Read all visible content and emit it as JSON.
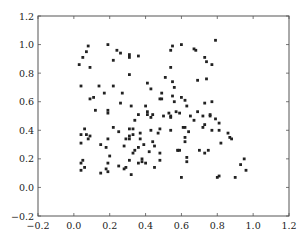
{
  "chart_data": {
    "type": "scatter",
    "title": "",
    "xlabel": "",
    "ylabel": "",
    "xlim": [
      -0.2,
      1.2
    ],
    "ylim": [
      -0.2,
      1.2
    ],
    "grid": false,
    "legend": null,
    "x_ticks": [
      "-0.2",
      "0.0",
      "0.2",
      "0.4",
      "0.6",
      "0.8",
      "1.0",
      "1.2"
    ],
    "y_ticks": [
      "-0.2",
      "0.0",
      "0.2",
      "0.4",
      "0.6",
      "0.8",
      "1.0",
      "1.2"
    ],
    "marker_color": "#222222",
    "series": [
      {
        "name": "points",
        "points": [
          [
            0.08,
            0.99
          ],
          [
            0.07,
            0.95
          ],
          [
            0.05,
            0.91
          ],
          [
            0.03,
            0.86
          ],
          [
            0.09,
            0.84
          ],
          [
            0.19,
            1.0
          ],
          [
            0.24,
            0.96
          ],
          [
            0.26,
            0.94
          ],
          [
            0.22,
            0.89
          ],
          [
            0.04,
            0.71
          ],
          [
            0.17,
            0.66
          ],
          [
            0.31,
            0.93
          ],
          [
            0.31,
            0.91
          ],
          [
            0.36,
            0.92
          ],
          [
            0.31,
            0.79
          ],
          [
            0.54,
            0.96
          ],
          [
            0.54,
            0.84
          ],
          [
            0.51,
            0.77
          ],
          [
            0.55,
            0.99
          ],
          [
            0.6,
            1.0
          ],
          [
            0.67,
            0.97
          ],
          [
            0.68,
            0.96
          ],
          [
            0.73,
            0.91
          ],
          [
            0.74,
            0.88
          ],
          [
            0.77,
            0.86
          ],
          [
            0.79,
            1.03
          ],
          [
            0.55,
            0.74
          ],
          [
            0.56,
            0.7
          ],
          [
            0.74,
            0.76
          ],
          [
            0.11,
            0.63
          ],
          [
            0.14,
            0.71
          ],
          [
            0.09,
            0.62
          ],
          [
            0.26,
            0.59
          ],
          [
            0.19,
            0.54
          ],
          [
            0.19,
            0.52
          ],
          [
            0.22,
            0.71
          ],
          [
            0.27,
            0.66
          ],
          [
            0.12,
            0.54
          ],
          [
            0.09,
            0.36
          ],
          [
            0.22,
            0.42
          ],
          [
            0.25,
            0.39
          ],
          [
            0.32,
            0.57
          ],
          [
            0.41,
            0.73
          ],
          [
            0.49,
            0.66
          ],
          [
            0.43,
            0.69
          ],
          [
            0.55,
            0.64
          ],
          [
            0.48,
            0.62
          ],
          [
            0.6,
            0.63
          ],
          [
            0.62,
            0.61
          ],
          [
            0.69,
            0.75
          ],
          [
            0.49,
            0.62
          ],
          [
            0.56,
            0.6
          ],
          [
            0.54,
            0.49
          ],
          [
            0.53,
            0.52
          ],
          [
            0.57,
            0.53
          ],
          [
            0.59,
            0.52
          ],
          [
            0.4,
            0.57
          ],
          [
            0.41,
            0.53
          ],
          [
            0.41,
            0.51
          ],
          [
            0.44,
            0.51
          ],
          [
            0.36,
            0.51
          ],
          [
            0.34,
            0.47
          ],
          [
            0.43,
            0.49
          ],
          [
            0.54,
            0.5
          ],
          [
            0.5,
            0.5
          ],
          [
            0.63,
            0.57
          ],
          [
            0.65,
            0.5
          ],
          [
            0.67,
            0.47
          ],
          [
            0.69,
            0.53
          ],
          [
            0.77,
            0.6
          ],
          [
            0.76,
            0.5
          ],
          [
            0.79,
            0.48
          ],
          [
            0.81,
            0.45
          ],
          [
            0.73,
            0.44
          ],
          [
            0.61,
            0.42
          ],
          [
            0.64,
            0.39
          ],
          [
            0.72,
            0.42
          ],
          [
            0.72,
            0.5
          ],
          [
            0.76,
            0.51
          ],
          [
            0.73,
            0.59
          ],
          [
            0.06,
            0.41
          ],
          [
            0.04,
            0.37
          ],
          [
            0.07,
            0.37
          ],
          [
            0.08,
            0.34
          ],
          [
            0.04,
            0.31
          ],
          [
            0.19,
            0.34
          ],
          [
            0.15,
            0.3
          ],
          [
            0.18,
            0.28
          ],
          [
            0.29,
            0.34
          ],
          [
            0.33,
            0.41
          ],
          [
            0.31,
            0.41
          ],
          [
            0.33,
            0.37
          ],
          [
            0.31,
            0.34
          ],
          [
            0.28,
            0.29
          ],
          [
            0.39,
            0.3
          ],
          [
            0.45,
            0.29
          ],
          [
            0.48,
            0.24
          ],
          [
            0.48,
            0.41
          ],
          [
            0.47,
            0.38
          ],
          [
            0.54,
            0.4
          ],
          [
            0.43,
            0.4
          ],
          [
            0.37,
            0.38
          ],
          [
            0.62,
            0.35
          ],
          [
            0.62,
            0.32
          ],
          [
            0.7,
            0.26
          ],
          [
            0.44,
            0.32
          ],
          [
            0.48,
            0.19
          ],
          [
            0.58,
            0.26
          ],
          [
            0.58,
            0.26
          ],
          [
            0.59,
            0.26
          ],
          [
            0.37,
            0.34
          ],
          [
            0.31,
            0.36
          ],
          [
            0.81,
            0.4
          ],
          [
            0.77,
            0.4
          ],
          [
            0.82,
            0.31
          ],
          [
            0.87,
            0.35
          ],
          [
            0.86,
            0.38
          ],
          [
            0.88,
            0.34
          ],
          [
            0.62,
            0.42
          ],
          [
            0.05,
            0.19
          ],
          [
            0.04,
            0.17
          ],
          [
            0.06,
            0.14
          ],
          [
            0.04,
            0.12
          ],
          [
            0.19,
            0.17
          ],
          [
            0.18,
            0.13
          ],
          [
            0.19,
            0.11
          ],
          [
            0.15,
            0.1
          ],
          [
            0.2,
            0.22
          ],
          [
            0.25,
            0.15
          ],
          [
            0.28,
            0.13
          ],
          [
            0.32,
            0.09
          ],
          [
            0.38,
            0.2
          ],
          [
            0.38,
            0.18
          ],
          [
            0.36,
            0.17
          ],
          [
            0.4,
            0.17
          ],
          [
            0.45,
            0.14
          ],
          [
            0.34,
            0.26
          ],
          [
            0.33,
            0.24
          ],
          [
            0.31,
            0.19
          ],
          [
            0.29,
            0.14
          ],
          [
            0.42,
            0.25
          ],
          [
            0.36,
            0.28
          ],
          [
            0.63,
            0.21
          ],
          [
            0.63,
            0.18
          ],
          [
            0.6,
            0.07
          ],
          [
            0.8,
            0.07
          ],
          [
            0.81,
            0.08
          ],
          [
            0.9,
            0.07
          ],
          [
            0.93,
            0.16
          ],
          [
            0.95,
            0.2
          ],
          [
            0.96,
            0.12
          ],
          [
            0.73,
            0.24
          ],
          [
            0.75,
            0.26
          ]
        ]
      }
    ]
  }
}
